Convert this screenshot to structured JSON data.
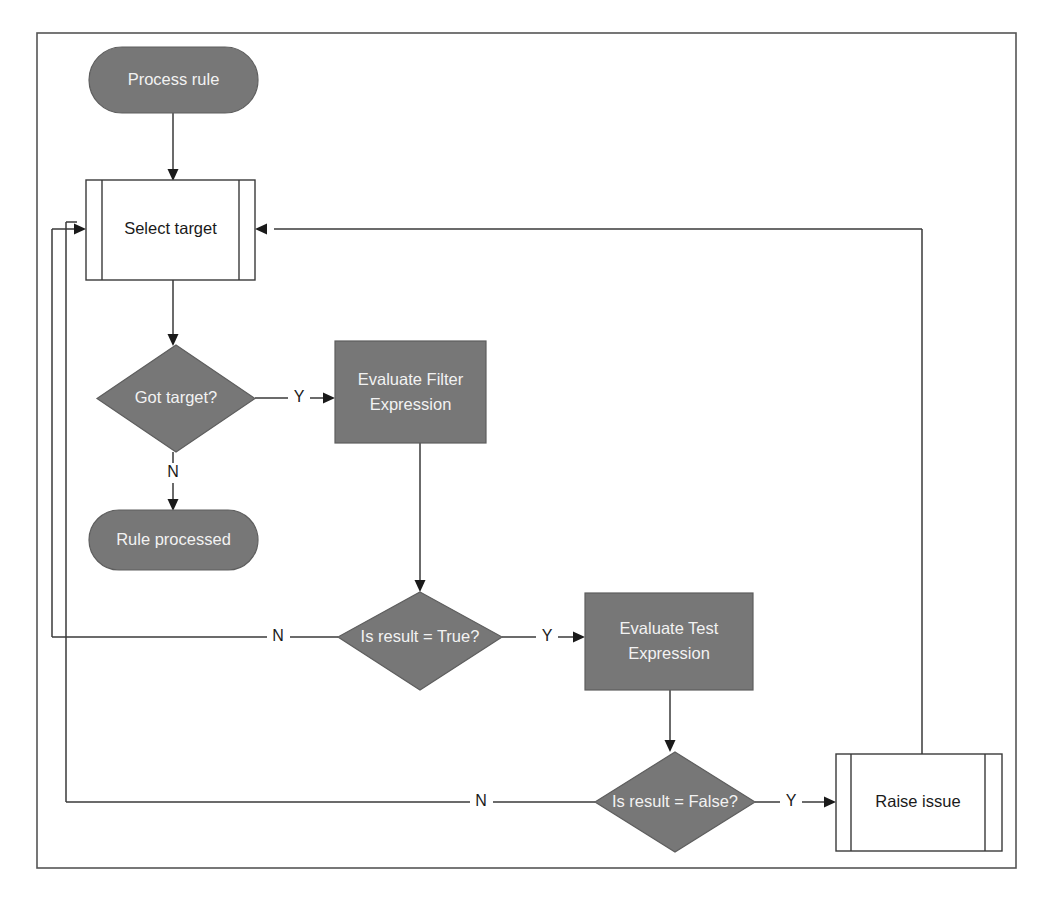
{
  "diagram": {
    "colors": {
      "shape_fill_gray": "#777777",
      "shape_fill_white": "#ffffff",
      "shape_stroke": "#3a3a3a",
      "edge_stroke": "#3a3a3a",
      "label_light": "#f2f2f2",
      "label_dark": "#1a1a1a",
      "frame_stroke": "#555555",
      "background": "#ffffff"
    },
    "nodes": {
      "start": {
        "label": "Process rule",
        "shape": "terminator",
        "fill": "gray"
      },
      "select_target": {
        "label": "Select target",
        "shape": "predefined-process",
        "fill": "white"
      },
      "got_target": {
        "label": "Got target?",
        "shape": "decision",
        "fill": "gray"
      },
      "rule_processed": {
        "label": "Rule processed",
        "shape": "terminator",
        "fill": "gray"
      },
      "evaluate_filter": {
        "label_line1": "Evaluate Filter",
        "label_line2": "Expression",
        "shape": "process",
        "fill": "gray"
      },
      "is_result_true": {
        "label": "Is result = True?",
        "shape": "decision",
        "fill": "gray"
      },
      "evaluate_test": {
        "label_line1": "Evaluate Test",
        "label_line2": "Expression",
        "shape": "process",
        "fill": "gray"
      },
      "is_result_false": {
        "label": "Is result = False?",
        "shape": "decision",
        "fill": "gray"
      },
      "raise_issue": {
        "label": "Raise issue",
        "shape": "predefined-process",
        "fill": "white"
      }
    },
    "edge_labels": {
      "got_target_yes": "Y",
      "got_target_no": "N",
      "is_result_true_yes": "Y",
      "is_result_true_no": "N",
      "is_result_false_yes": "Y",
      "is_result_false_no": "N"
    },
    "edges": [
      {
        "from": "start",
        "to": "select_target",
        "label": ""
      },
      {
        "from": "select_target",
        "to": "got_target",
        "label": ""
      },
      {
        "from": "got_target",
        "to": "evaluate_filter",
        "label": "Y"
      },
      {
        "from": "got_target",
        "to": "rule_processed",
        "label": "N"
      },
      {
        "from": "evaluate_filter",
        "to": "is_result_true",
        "label": ""
      },
      {
        "from": "is_result_true",
        "to": "evaluate_test",
        "label": "Y"
      },
      {
        "from": "is_result_true",
        "to": "select_target",
        "label": "N"
      },
      {
        "from": "evaluate_test",
        "to": "is_result_false",
        "label": ""
      },
      {
        "from": "is_result_false",
        "to": "raise_issue",
        "label": "Y"
      },
      {
        "from": "is_result_false",
        "to": "select_target",
        "label": "N"
      },
      {
        "from": "raise_issue",
        "to": "select_target",
        "label": ""
      }
    ]
  }
}
